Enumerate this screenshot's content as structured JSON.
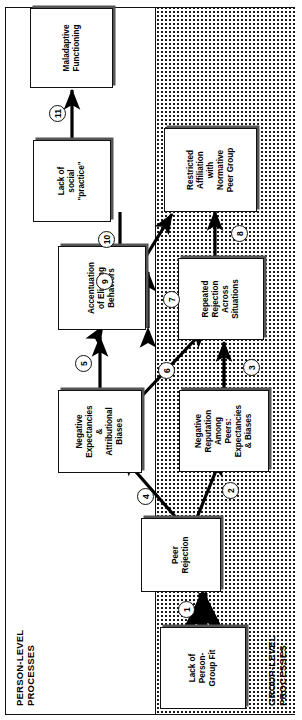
{
  "figure": {
    "regions": [
      {
        "id": "person",
        "label": "PERSON-LEVEL\nPROCESSES",
        "shading": "plain-white"
      },
      {
        "id": "group",
        "label": "GROUP-LEVEL\nPROCESSES",
        "shading": "stippled-dots"
      }
    ]
  },
  "nodes": [
    {
      "id": "n1",
      "label": "Lack of\nPerson-\nGroup Fit",
      "region": "person"
    },
    {
      "id": "n2",
      "label": "Peer\nRejection",
      "region": "person"
    },
    {
      "id": "n3",
      "label": "Negative\nExpectancies\n&\nAttributional\nBiases",
      "region": "person"
    },
    {
      "id": "n4",
      "label": "Negative\nReputation\nAmong\nPeers:\nExpectancies\n& Biases",
      "region": "group"
    },
    {
      "id": "n5",
      "label": "Accentuation\nof Eliciting\nBehaviors",
      "region": "person"
    },
    {
      "id": "n6",
      "label": "Repeated\nRejection\nAcross\nSituations",
      "region": "group"
    },
    {
      "id": "n7",
      "label": "Lack of\nsocial\n\"practice\"",
      "region": "person"
    },
    {
      "id": "n8",
      "label": "Restricted\nAffiliation\nwith\nNormative\nPeer Group",
      "region": "group"
    },
    {
      "id": "n9",
      "label": "Maladaptive\nFunctioning",
      "region": "person"
    }
  ],
  "links": [
    {
      "num": "1",
      "from": "n1",
      "to": "n2",
      "style": "thick-solid",
      "heads": "single"
    },
    {
      "num": "2",
      "from": "n2",
      "to": "n4",
      "style": "solid-diagonal",
      "heads": "single"
    },
    {
      "num": "3",
      "from": "n4",
      "to": "n6",
      "style": "solid",
      "heads": "single"
    },
    {
      "num": "4",
      "from": "n2",
      "to": "n3",
      "style": "solid-diagonal",
      "heads": "single"
    },
    {
      "num": "5",
      "from": "n3",
      "to": "n5",
      "style": "solid",
      "heads": "single"
    },
    {
      "num": "6",
      "from": "n3",
      "to": "n6",
      "style": "solid-diagonal",
      "heads": "single"
    },
    {
      "num": "7",
      "from": "n5",
      "to": "n6",
      "style": "solid",
      "heads": "double"
    },
    {
      "num": "8",
      "from": "n6",
      "to": "n8",
      "style": "solid",
      "heads": "single"
    },
    {
      "num": "9",
      "from": "n5",
      "to": "n8",
      "style": "solid-diagonal",
      "heads": "double"
    },
    {
      "num": "10",
      "from": "n8",
      "to": "n7",
      "style": "solid",
      "heads": "single"
    },
    {
      "num": "11",
      "from": "n7",
      "to": "n9",
      "style": "solid",
      "heads": "single"
    }
  ]
}
